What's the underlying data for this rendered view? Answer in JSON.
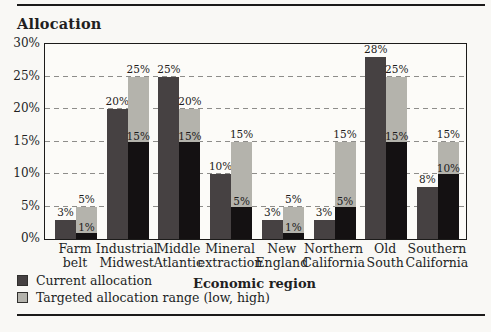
{
  "colors": {
    "current_allocation": "#464142",
    "target_high": "#b4b3ac",
    "target_low": "#141112",
    "axis_line": "#1c1b1a",
    "gridline": "#8e8d8a",
    "background": "#f9f8f5"
  },
  "chart_data": {
    "type": "bar",
    "title": "Allocation",
    "xlabel": "Economic region",
    "ylabel": "",
    "ylim": [
      0,
      30
    ],
    "grid": "horizontal dashed lines every 5%",
    "legend_position": "bottom-left",
    "yticks": [
      {
        "value": 0,
        "label": "0%"
      },
      {
        "value": 5,
        "label": "5%"
      },
      {
        "value": 10,
        "label": "10%"
      },
      {
        "value": 15,
        "label": "15%"
      },
      {
        "value": 20,
        "label": "20%"
      },
      {
        "value": 25,
        "label": "25%"
      },
      {
        "value": 30,
        "label": "30%"
      }
    ],
    "categories": [
      "Farm belt",
      "Industrial Midwest",
      "Middle Atlantic",
      "Mineral extraction",
      "New England",
      "Northern California",
      "Old South",
      "Southern California"
    ],
    "category_lines": [
      [
        "Farm",
        "belt"
      ],
      [
        "Industrial",
        "Midwest"
      ],
      [
        "Middle",
        "Atlantic"
      ],
      [
        "Mineral",
        "extraction"
      ],
      [
        "New",
        "England"
      ],
      [
        "Northern",
        "California"
      ],
      [
        "Old",
        "South"
      ],
      [
        "Southern",
        "California"
      ]
    ],
    "series": [
      {
        "name": "Current allocation",
        "values": [
          3,
          20,
          25,
          10,
          3,
          3,
          28,
          8
        ]
      },
      {
        "name": "Targeted allocation range low",
        "values": [
          1,
          15,
          15,
          5,
          1,
          5,
          15,
          10
        ]
      },
      {
        "name": "Targeted allocation range high",
        "values": [
          5,
          25,
          20,
          15,
          5,
          15,
          25,
          15
        ]
      }
    ],
    "bar_labels": {
      "current": [
        "3%",
        "20%",
        "25%",
        "10%",
        "3%",
        "3%",
        "28%",
        "8%"
      ],
      "low": [
        "1%",
        "15%",
        "15%",
        "5%",
        "1%",
        "5%",
        "15%",
        "10%"
      ],
      "high": [
        "5%",
        "25%",
        "20%",
        "15%",
        "5%",
        "15%",
        "25%",
        "15%"
      ]
    }
  },
  "legend": {
    "items": [
      {
        "label": "Current allocation"
      },
      {
        "label": "Targeted allocation range (low, high)"
      }
    ]
  }
}
